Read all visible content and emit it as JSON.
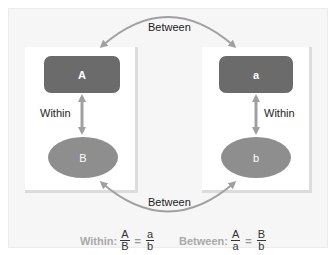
{
  "diagram": {
    "top_relation_label": "Between",
    "bottom_relation_label": "Between",
    "left_pair": {
      "top_node": "A",
      "bottom_node": "B",
      "relation_label": "Within"
    },
    "right_pair": {
      "top_node": "a",
      "bottom_node": "b",
      "relation_label": "Within"
    },
    "formulas": {
      "within": {
        "label": "Within:",
        "lhs_num": "A",
        "lhs_den": "B",
        "equals": "=",
        "rhs_num": "a",
        "rhs_den": "b"
      },
      "between": {
        "label": "Between:",
        "lhs_num": "A",
        "lhs_den": "a",
        "equals": "=",
        "rhs_num": "B",
        "rhs_den": "b"
      }
    },
    "colors": {
      "rect_fill": "#6b6b6b",
      "ellipse_fill": "#8e8e8e",
      "arrow": "#a0a0a0",
      "background": "#f6f6f6"
    }
  }
}
